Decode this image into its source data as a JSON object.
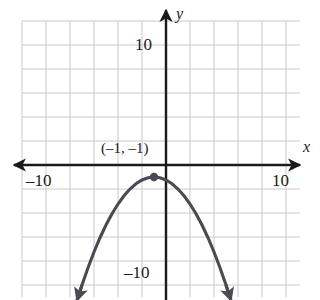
{
  "figure": {
    "background_color": "#ffffff",
    "grid_color": "#c9c9cf",
    "axis_color": "#1a1a1a",
    "curve_color": "#4a4a52"
  },
  "axes": {
    "x_name": "x",
    "y_name": "y",
    "x_labels": [
      {
        "name": "x-tick-negative-ten",
        "text": "–10",
        "value": -10
      },
      {
        "name": "x-tick-positive-ten",
        "text": "10",
        "value": 10
      }
    ],
    "y_labels": [
      {
        "name": "y-tick-positive-ten",
        "text": "10",
        "value": 10
      },
      {
        "name": "y-tick-negative-ten",
        "text": "–10",
        "value": -10
      }
    ]
  },
  "annotations": [
    {
      "name": "vertex-label",
      "text": "(–1, –1)",
      "point": {
        "x": -1,
        "y": -1
      }
    }
  ],
  "chart_data": {
    "type": "line",
    "title": "",
    "subtitle": "",
    "xlabel": "x",
    "ylabel": "y",
    "xlim": [
      -12,
      10
    ],
    "ylim": [
      -11.25,
      11.25
    ],
    "grid": true,
    "grid_step": 2,
    "legend": "none",
    "equation": "y = -0.25(x + 1)^2 - 1",
    "vertex": {
      "x": -1,
      "y": -1
    },
    "opens": "down",
    "marked_points": [
      {
        "x": -1,
        "y": -1,
        "label": "(–1, –1)"
      }
    ],
    "series": [
      {
        "name": "parabola",
        "color": "#4a4a52",
        "x": [
          -7.4,
          -7,
          -6.5,
          -6,
          -5.5,
          -5,
          -4.5,
          -4,
          -3.5,
          -3,
          -2.5,
          -2,
          -1.5,
          -1,
          -0.5,
          0,
          0.5,
          1,
          1.5,
          2,
          2.5,
          3,
          3.5,
          4,
          4.5,
          5,
          5.4
        ],
        "y": [
          -11.24,
          -10.0,
          -8.56,
          -7.25,
          -6.06,
          -5.0,
          -4.06,
          -3.25,
          -2.56,
          -2.0,
          -1.56,
          -1.25,
          -1.06,
          -1.0,
          -1.06,
          -1.25,
          -1.56,
          -2.0,
          -2.56,
          -3.25,
          -4.06,
          -5.0,
          -6.06,
          -7.25,
          -8.56,
          -10.0,
          -11.24
        ]
      }
    ]
  }
}
